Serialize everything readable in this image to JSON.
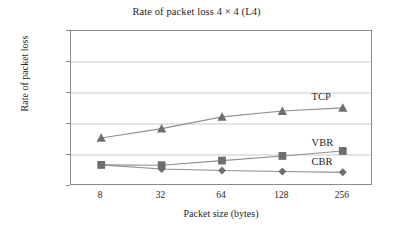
{
  "chart_data": {
    "type": "line",
    "title": "Rate of packet loss 4 × 4 (L4)",
    "xlabel": "Packet size (bytes)",
    "ylabel": "Rate of packet loss",
    "categories": [
      "8",
      "32",
      "64",
      "128",
      "256"
    ],
    "ylim": [
      0.001,
      0.006
    ],
    "ytick_labels": [
      "0.006",
      "0.005",
      "0.004",
      "0.003",
      "0.002",
      "0.001"
    ],
    "ytick_values": [
      0.006,
      0.005,
      0.004,
      0.003,
      0.002,
      0.001
    ],
    "grid": true,
    "legend_position": "inline-annotations",
    "series": [
      {
        "name": "TCP",
        "marker": "triangle",
        "color": "#6e6e6e",
        "values": [
          0.00255,
          0.00285,
          0.00323,
          0.00342,
          0.00352
        ]
      },
      {
        "name": "VBR",
        "marker": "square",
        "color": "#6e6e6e",
        "values": [
          0.00168,
          0.00167,
          0.00182,
          0.00197,
          0.00213
        ]
      },
      {
        "name": "CBR",
        "marker": "diamond",
        "color": "#6e6e6e",
        "values": [
          0.00168,
          0.00155,
          0.0015,
          0.00147,
          0.00144
        ]
      }
    ],
    "annotations": [
      {
        "text": "TCP",
        "x_frac": 0.8,
        "y_value": 0.00382
      },
      {
        "text": "VBR",
        "x_frac": 0.8,
        "y_value": 0.00232
      },
      {
        "text": "CBR",
        "x_frac": 0.8,
        "y_value": 0.00172
      }
    ]
  },
  "ticks": {
    "y": [
      "0.006",
      "0.005",
      "0.004",
      "0.003",
      "0.002",
      "0.001"
    ],
    "x": [
      "8",
      "32",
      "64",
      "128",
      "256"
    ]
  },
  "labels": {
    "title": "Rate of packet loss 4 × 4 (L4)",
    "x_axis": "Packet size (bytes)",
    "y_axis": "Rate of packet loss",
    "tcp": "TCP",
    "vbr": "VBR",
    "cbr": "CBR"
  },
  "colors": {
    "marker": "#6e6e6e",
    "line": "#8f8f8f",
    "grid": "#c9c9c9",
    "axis": "#8a8a8a",
    "text": "#262626",
    "background": "#ffffff"
  }
}
